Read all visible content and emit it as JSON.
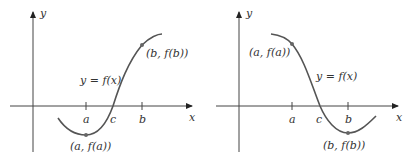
{
  "panels": [
    {
      "id": "left",
      "axis_labels": {
        "x": "x",
        "y": "y"
      },
      "ticks": {
        "a": "a",
        "c": "c",
        "b": "b"
      },
      "curve_label": "y = f(x)",
      "point_a_label": "(a, f(a))",
      "point_b_label": "(b, f(b))",
      "description": "f(a) < 0 < f(b): curve increases through c"
    },
    {
      "id": "right",
      "axis_labels": {
        "x": "x",
        "y": "y"
      },
      "ticks": {
        "a": "a",
        "c": "c",
        "b": "b"
      },
      "curve_label": "y = f(x)",
      "point_a_label": "(a, f(a))",
      "point_b_label": "(b, f(b))",
      "description": "f(a) > 0 > f(b): curve decreases through c"
    }
  ]
}
